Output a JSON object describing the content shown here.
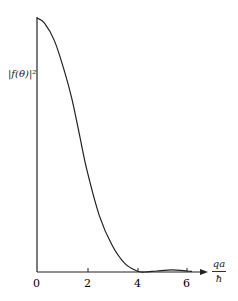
{
  "chart_data": {
    "type": "line",
    "title": "",
    "xlabel": "qa/ħ",
    "ylabel": "|f(θ)|²",
    "x_ticks": [
      "0",
      "2",
      "4",
      "6"
    ],
    "xlim": [
      0,
      6.6
    ],
    "ylim": [
      0,
      1
    ],
    "grid": false,
    "legend": null,
    "series": [
      {
        "name": "|f(θ)|²",
        "x": [
          0,
          0.3,
          0.7,
          1.1,
          1.4,
          1.7,
          2.0,
          2.5,
          3.0,
          3.5,
          4.0,
          4.3,
          4.8,
          5.4,
          6.0,
          6.2
        ],
        "y": [
          1.0,
          0.98,
          0.91,
          0.79,
          0.68,
          0.54,
          0.4,
          0.22,
          0.106,
          0.035,
          0.004,
          0.0,
          0.004,
          0.008,
          0.004,
          0.002
        ]
      }
    ]
  },
  "labels": {
    "y_axis": "|f(θ)|²",
    "x_axis_num": "qa",
    "x_axis_den": "ħ",
    "tick_0": "0",
    "tick_2": "2",
    "tick_4": "4",
    "tick_6": "6"
  }
}
